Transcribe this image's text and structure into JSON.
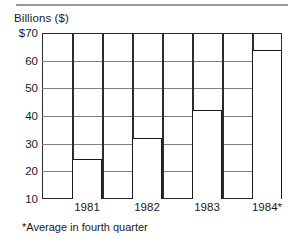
{
  "figure": {
    "axis_title": "Billions ($)",
    "footnote": "*Average in fourth quarter"
  },
  "chart_data": {
    "type": "bar",
    "title": "",
    "subtitle": "",
    "xlabel": "",
    "ylabel": "Billions ($)",
    "categories": [
      "1981",
      "1982",
      "1983",
      "1984*"
    ],
    "values": [
      24.5,
      32.0,
      42.0,
      64.0
    ],
    "ylim": [
      10,
      70
    ],
    "yticks": [
      10,
      20,
      30,
      40,
      50,
      60,
      70
    ],
    "ytick_labels": [
      "10",
      "20",
      "30",
      "40",
      "50",
      "60",
      "$70"
    ],
    "grid": true,
    "legend": null,
    "annotations": [
      "*Average in fourth quarter"
    ],
    "bar_facecolor": "#ffffff",
    "bar_edgecolor": "#1a1a1a",
    "grid_color": "#808080",
    "axis_color": "#2b2b2b"
  }
}
